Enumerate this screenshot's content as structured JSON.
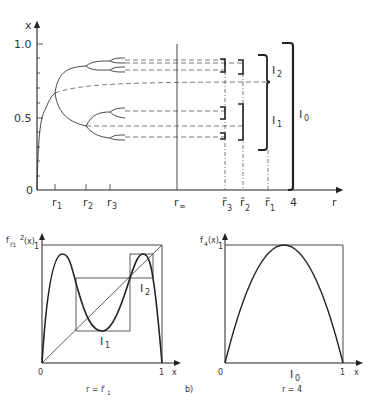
{
  "top_plot": {
    "y_axis_label": "x",
    "x_axis_label": "r",
    "y_ticks": [
      "1.0",
      "0.5",
      "0"
    ],
    "x_ticks": [
      "r1",
      "r2",
      "r3",
      "r∞",
      "r̃3",
      "r̃2",
      "r̃1",
      "4"
    ],
    "x_tick_display": {
      "r1": "r",
      "r1_sub": "1",
      "r2": "r",
      "r2_sub": "2",
      "r3": "r",
      "r3_sub": "3",
      "rinf": "r",
      "rinf_sub": "∞",
      "rt3": "r̃",
      "rt3_sub": "3",
      "rt2": "r̃",
      "rt2_sub": "2",
      "rt1": "r̃",
      "rt1_sub": "1",
      "four": "4"
    },
    "intervals": {
      "I0": "I",
      "I0_sub": "0",
      "I1": "I",
      "I1_sub": "1",
      "I2": "I",
      "I2_sub": "2"
    }
  },
  "bottom_left": {
    "y_axis_label": "f",
    "y_axis_sup": "2",
    "y_axis_sub": "r̃1",
    "y_axis_arg": "(x)",
    "x_axis_label": "x",
    "y_tick": "1",
    "x_ticks": [
      "0",
      "1"
    ],
    "interval_labels": {
      "I1": "I",
      "I1_sub": "1",
      "I2": "I",
      "I2_sub": "2"
    },
    "caption": "r = r̃",
    "caption_sub": "1",
    "panel_label": "b)"
  },
  "bottom_right": {
    "y_axis_label": "f",
    "y_axis_sub": "4",
    "y_axis_arg": "(x)",
    "x_axis_label": "x",
    "y_tick": "1",
    "x_ticks": [
      "0",
      "1"
    ],
    "interval_label": "I",
    "interval_sub": "0",
    "caption": "r = 4"
  }
}
